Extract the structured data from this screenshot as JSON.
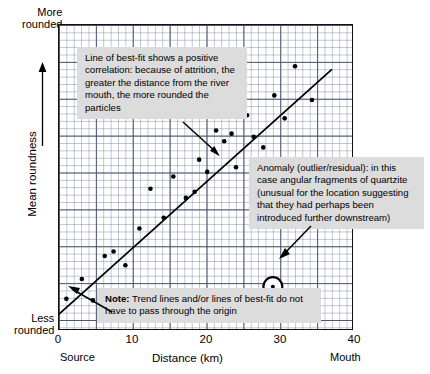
{
  "chart_data": {
    "type": "scatter",
    "title": "",
    "xlabel": "Distance (km)",
    "ylabel": "Mean roundness",
    "xlim": [
      0,
      40
    ],
    "ylim": [
      0,
      10
    ],
    "xticks": [
      "0",
      "10",
      "20",
      "30",
      "40"
    ],
    "xtick_values": [
      0,
      10,
      20,
      30,
      40
    ],
    "grid": true,
    "grid_minor_step_x": 1,
    "grid_major_step_x": 5,
    "legend": "none",
    "axis_end_labels": {
      "x_left": "Source",
      "x_right": "Mouth",
      "y_top": "More\nrounded",
      "y_bottom": "Less\nrounded"
    },
    "series": [
      {
        "name": "Pebble samples",
        "points": [
          {
            "x": 1.0,
            "y": 1.05
          },
          {
            "x": 3.1,
            "y": 1.7
          },
          {
            "x": 4.6,
            "y": 1.0
          },
          {
            "x": 6.2,
            "y": 2.45
          },
          {
            "x": 7.4,
            "y": 2.6
          },
          {
            "x": 9.0,
            "y": 2.15
          },
          {
            "x": 10.9,
            "y": 3.35
          },
          {
            "x": 12.4,
            "y": 4.65
          },
          {
            "x": 14.2,
            "y": 3.7
          },
          {
            "x": 15.5,
            "y": 5.05
          },
          {
            "x": 17.2,
            "y": 4.35
          },
          {
            "x": 18.4,
            "y": 4.55
          },
          {
            "x": 19.0,
            "y": 5.6
          },
          {
            "x": 20.1,
            "y": 5.2
          },
          {
            "x": 21.3,
            "y": 6.55
          },
          {
            "x": 22.4,
            "y": 6.2
          },
          {
            "x": 23.4,
            "y": 6.45
          },
          {
            "x": 24.0,
            "y": 5.35
          },
          {
            "x": 25.5,
            "y": 7.05
          },
          {
            "x": 26.4,
            "y": 6.35
          },
          {
            "x": 27.7,
            "y": 6.0
          },
          {
            "x": 29.2,
            "y": 7.7
          },
          {
            "x": 30.6,
            "y": 6.95
          },
          {
            "x": 32.0,
            "y": 8.65
          },
          {
            "x": 34.3,
            "y": 7.55
          }
        ]
      },
      {
        "name": "Anomaly (circled outlier)",
        "points": [
          {
            "x": 29.0,
            "y": 1.45
          }
        ],
        "marker": "circled"
      }
    ],
    "trendline": {
      "name": "Line of best-fit",
      "x_start": 0.0,
      "y_start": 0.55,
      "x_end": 37.0,
      "y_end": 8.55,
      "note": "does not pass through the origin"
    }
  },
  "annotations": {
    "bestfit": "Line of best-fit shows a positive correlation: because of attrition, the greater the distance from the river mouth, the more rounded the particles",
    "anomaly": "Anomaly (outlier/residual): in this case angular fragments of quartzite (unusual for the location suggesting that they had perhaps been introduced further downstream)",
    "note_label": "Note:",
    "note_text": " Trend lines and/or lines of best-fit do not have to pass through the origin"
  },
  "colors": {
    "ink": "#000000",
    "grid_minor": "#8a94b4",
    "grid_major": "#2a3246",
    "callout_bg": "#dcdcdc",
    "plot_bg": "#ffffff"
  }
}
